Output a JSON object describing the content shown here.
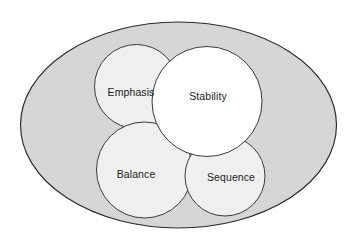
{
  "diagram": {
    "type": "venn-diagram",
    "canvas": {
      "width": 357,
      "height": 246,
      "background_color": "#ffffff"
    },
    "container": {
      "name": "outer-ellipse",
      "label": "",
      "fill_color": "#d9d9d9",
      "stroke_color": "#2a2a2a",
      "cx": 178.5,
      "cy": 125,
      "rx": 158,
      "ry": 103
    },
    "sets": [
      {
        "id": "emphasis",
        "label": "Emphasis",
        "cx": 136.5,
        "cy": 86.5,
        "r": 42,
        "fill_color": "#f1f1f1",
        "stroke_color": "#3a3a3a",
        "label_x": 131,
        "label_y": 93
      },
      {
        "id": "stability",
        "label": "Stability",
        "cx": 207,
        "cy": 101.5,
        "r": 55,
        "fill_color": "#ffffff",
        "stroke_color": "#3a3a3a",
        "label_x": 208,
        "label_y": 97
      },
      {
        "id": "balance",
        "label": "Balance",
        "cx": 144.5,
        "cy": 170,
        "r": 48,
        "fill_color": "#eeeeee",
        "stroke_color": "#3a3a3a",
        "label_x": 136,
        "label_y": 175
      },
      {
        "id": "sequence",
        "label": "Sequence",
        "cx": 225,
        "cy": 176,
        "r": 40,
        "fill_color": "#eeeeee",
        "stroke_color": "#3a3a3a",
        "label_x": 231,
        "label_y": 178
      }
    ]
  }
}
